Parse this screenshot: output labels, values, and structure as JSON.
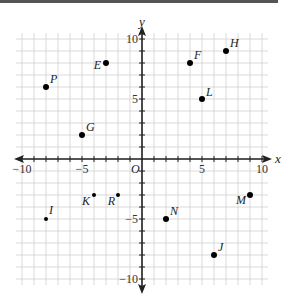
{
  "chart_data": {
    "type": "scatter",
    "title": "",
    "xlabel": "x",
    "ylabel": "y",
    "origin_label": "O",
    "xlim": [
      -10,
      10
    ],
    "ylim": [
      -10,
      10
    ],
    "grid": true,
    "x_ticks": [
      -10,
      -5,
      5,
      10
    ],
    "x_tick_labels": [
      "−10",
      "−5",
      "5",
      "10"
    ],
    "y_ticks": [
      10,
      5,
      -5,
      -10
    ],
    "y_tick_labels": [
      "10",
      "5",
      "−5",
      "−10"
    ],
    "points": [
      {
        "label": "P",
        "x": -8,
        "y": 6
      },
      {
        "label": "E",
        "x": -3,
        "y": 8
      },
      {
        "label": "G",
        "x": -5,
        "y": 2
      },
      {
        "label": "F",
        "x": 4,
        "y": 8
      },
      {
        "label": "H",
        "x": 7,
        "y": 9
      },
      {
        "label": "L",
        "x": 5,
        "y": 5
      },
      {
        "label": "I",
        "x": -8,
        "y": -5
      },
      {
        "label": "K",
        "x": -4,
        "y": -3
      },
      {
        "label": "R",
        "x": -2,
        "y": -3
      },
      {
        "label": "N",
        "x": 2,
        "y": -5
      },
      {
        "label": "J",
        "x": 6,
        "y": -8
      },
      {
        "label": "M",
        "x": 9,
        "y": -3
      }
    ]
  },
  "colors": {
    "grid": "#d0d0d0",
    "axis": "#222222",
    "point": "#000000",
    "topbar": "#555555"
  }
}
